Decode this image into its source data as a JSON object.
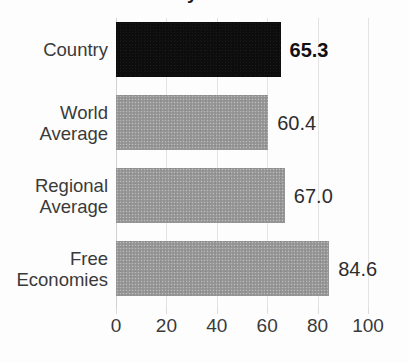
{
  "chart_data": {
    "type": "bar",
    "orientation": "horizontal",
    "title": "Economy Scorecard",
    "title_visible": false,
    "title_note": "clipped at top edge of screenshot",
    "categories": [
      "Country",
      "World Average",
      "Regional Average",
      "Free Economies"
    ],
    "category_lines": [
      [
        "Country"
      ],
      [
        "World",
        "Average"
      ],
      [
        "Regional",
        "Average"
      ],
      [
        "Free",
        "Economies"
      ]
    ],
    "values": [
      65.3,
      60.4,
      67.0,
      84.6
    ],
    "value_labels": [
      "65.3",
      "60.4",
      "67.0",
      "84.6"
    ],
    "highlighted_index": 0,
    "bar_colors": [
      "#0d0d0d",
      "#9b9b9b",
      "#9b9b9b",
      "#9b9b9b"
    ],
    "xlabel": "",
    "ylabel": "",
    "xlim": [
      0,
      100
    ],
    "xticks": [
      0,
      20,
      40,
      60,
      80,
      100
    ],
    "xtick_labels": [
      "0",
      "20",
      "40",
      "60",
      "80",
      "100"
    ],
    "grid": true,
    "grid_axis": "x",
    "legend": false,
    "colors": {
      "highlight": "#0d0d0d",
      "bar": "#9b9b9b",
      "grid": "#e3e3e3",
      "text": "#3a3a3a",
      "background": "#fdfdfd"
    }
  }
}
